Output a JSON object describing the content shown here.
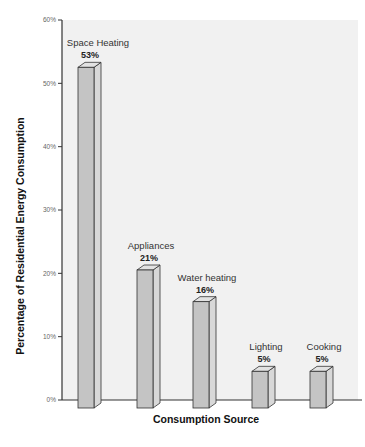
{
  "chart_data": {
    "type": "bar",
    "title": "",
    "xlabel": "Consumption Source",
    "ylabel": "Percentage of Residential Energy Consumption",
    "ylim": [
      0,
      60
    ],
    "yticks": [
      "0%",
      "10%",
      "20%",
      "30%",
      "40%",
      "50%",
      "60%"
    ],
    "grid": false,
    "legend": null,
    "style": "3d-bars",
    "categories": [
      "Space Heating",
      "Appliances",
      "Water heating",
      "Lighting",
      "Cooking"
    ],
    "values": [
      53,
      21,
      16,
      5,
      5
    ],
    "value_labels": [
      "53%",
      "21%",
      "16%",
      "5%",
      "5%"
    ]
  },
  "colors": {
    "plot_background": "#f1f1f1",
    "bar_front": "#c4c4c4",
    "bar_side": "#d8d8d8",
    "bar_top": "#e2e2e2",
    "bar_stroke": "#333333",
    "axis": "#333333"
  }
}
